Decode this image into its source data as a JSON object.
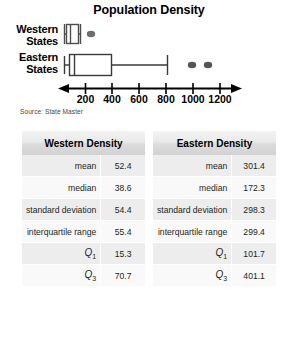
{
  "chart_data": {
    "type": "boxplot",
    "title": "Population Density",
    "source": "Source: State Master",
    "xlabel": "",
    "ylabel": "",
    "xlim": [
      0,
      1300
    ],
    "ticks": [
      200,
      400,
      600,
      800,
      1000,
      1200
    ],
    "tick_labels": [
      "200",
      "400",
      "600",
      "800",
      "1000",
      "1200"
    ],
    "grid": false,
    "legend": "none",
    "series": [
      {
        "name": "Western States",
        "label_line1": "Western",
        "label_line2": "States",
        "min": 1,
        "q1": 15.3,
        "median": 38.6,
        "q3": 70.7,
        "whisker_high": 90,
        "outliers": [
          210
        ]
      },
      {
        "name": "Eastern States",
        "label_line1": "Eastern",
        "label_line2": "States",
        "min": 40,
        "q1": 101.7,
        "median": 172.3,
        "q3": 401.1,
        "whisker_high": 800,
        "outliers": [
          1000,
          1110
        ]
      }
    ]
  },
  "tables": [
    {
      "header": "Western Density",
      "rows": [
        {
          "key": "mean",
          "value": "52.4",
          "key_style": "plain"
        },
        {
          "key": "median",
          "value": "38.6",
          "key_style": "plain"
        },
        {
          "key": "standard deviation",
          "value": "54.4",
          "key_style": "plain"
        },
        {
          "key": "interquartile range",
          "value": "55.4",
          "key_style": "plain"
        },
        {
          "key": "Q1",
          "value": "15.3",
          "key_style": "quartile"
        },
        {
          "key": "Q3",
          "value": "70.7",
          "key_style": "quartile"
        }
      ]
    },
    {
      "header": "Eastern Density",
      "rows": [
        {
          "key": "mean",
          "value": "301.4",
          "key_style": "plain"
        },
        {
          "key": "median",
          "value": "172.3",
          "key_style": "plain"
        },
        {
          "key": "standard deviation",
          "value": "298.3",
          "key_style": "plain"
        },
        {
          "key": "interquartile range",
          "value": "299.4",
          "key_style": "plain"
        },
        {
          "key": "Q1",
          "value": "101.7",
          "key_style": "quartile"
        },
        {
          "key": "Q3",
          "value": "401.1",
          "key_style": "quartile"
        }
      ]
    }
  ]
}
